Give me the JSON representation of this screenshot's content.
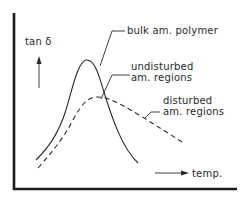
{
  "figure": {
    "y_axis_label": "tan δ",
    "x_axis_label": "temp.",
    "curves": [
      {
        "id": "bulk",
        "label": "bulk am. polymer",
        "style": "solid",
        "color": "#2a2a2a"
      },
      {
        "id": "undisturbed",
        "label_line1": "undisturbed",
        "label_line2": "am. regions",
        "style": "dashed",
        "color": "#2a2a2a"
      },
      {
        "id": "disturbed",
        "label_line1": "disturbed",
        "label_line2": "am. regions",
        "style": "dashed",
        "color": "#2a2a2a"
      }
    ],
    "colors": {
      "axis": "#1a1a1a",
      "ink": "#2a2a2a",
      "background": "#ffffff"
    }
  }
}
